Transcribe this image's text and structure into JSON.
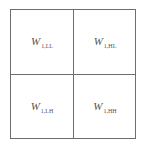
{
  "diagram": {
    "type": "wavelet-subband-decomposition",
    "cells": [
      {
        "position": "top-left",
        "symbol": "W",
        "subscript": "1,LL"
      },
      {
        "position": "top-right",
        "symbol": "W",
        "subscript": "1,HL"
      },
      {
        "position": "bottom-left",
        "symbol": "W",
        "subscript": "1,LH"
      },
      {
        "position": "bottom-right",
        "symbol": "W",
        "subscript": "1,HH"
      }
    ],
    "colors": {
      "border": "#6e6e6e",
      "text": "#555555",
      "background": "#ffffff"
    }
  }
}
